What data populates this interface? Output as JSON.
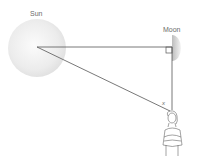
{
  "labels": {
    "sun": "Sun",
    "moon": "Moon",
    "angle": "x"
  },
  "colors": {
    "line": "#555555",
    "sun_fill": "#e8e8e8",
    "moon_fill": "#cfcfcf",
    "label": "#6b6b6b"
  }
}
